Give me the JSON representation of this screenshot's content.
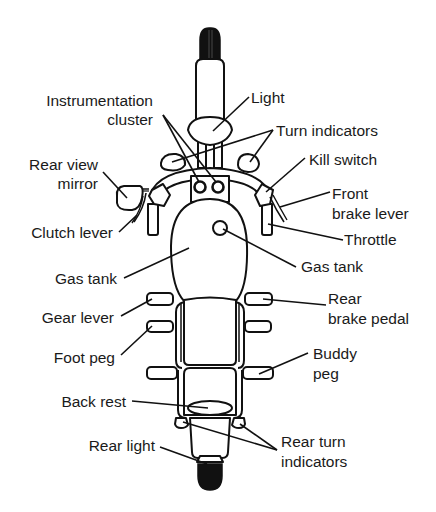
{
  "diagram": {
    "colors": {
      "line": "#111111",
      "background": "#ffffff",
      "tire": "#111111"
    },
    "labels": {
      "instrumentation_cluster": {
        "line1": "Instrumentation",
        "line2": "cluster"
      },
      "light": "Light",
      "turn_indicators": "Turn indicators",
      "rear_view_mirror": {
        "line1": "Rear view",
        "line2": "mirror"
      },
      "kill_switch": "Kill switch",
      "front_brake_lever": {
        "line1": "Front",
        "line2": "brake lever"
      },
      "clutch_lever": "Clutch lever",
      "throttle": "Throttle",
      "gas_tank_left": "Gas tank",
      "gas_tank_right": "Gas tank",
      "gear_lever": "Gear lever",
      "rear_brake_pedal": {
        "line1": "Rear",
        "line2": "brake pedal"
      },
      "foot_peg": "Foot peg",
      "buddy_peg": {
        "line1": "Buddy",
        "line2": "peg"
      },
      "back_rest": "Back rest",
      "rear_light": "Rear light",
      "rear_turn_indicators": {
        "line1": "Rear turn",
        "line2": "indicators"
      }
    }
  }
}
